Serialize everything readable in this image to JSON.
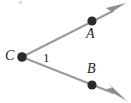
{
  "figure": {
    "kind": "geometry-angle-diagram",
    "width": 131,
    "height": 103,
    "background_color": "#ffffff",
    "vertex": {
      "name": "vertex-c",
      "label": "C",
      "x": 22,
      "y": 57
    },
    "points": [
      {
        "name": "point-a",
        "label": "A",
        "x": 92,
        "y": 21,
        "label_position": "below-right"
      },
      {
        "name": "point-b",
        "label": "B",
        "x": 92,
        "y": 85,
        "label_position": "above-right"
      }
    ],
    "angle": {
      "name": "angle-1",
      "label": "1",
      "label_x": 46,
      "label_y": 57
    },
    "rays": [
      {
        "name": "ray-ca",
        "from": "C",
        "through": "A",
        "start": {
          "x": 22,
          "y": 57
        },
        "end": {
          "x": 122,
          "y": 6
        },
        "arrowhead": true
      },
      {
        "name": "ray-cb",
        "from": "C",
        "through": "B",
        "start": {
          "x": 22,
          "y": 57
        },
        "end": {
          "x": 122,
          "y": 97
        },
        "arrowhead": true
      }
    ],
    "style": {
      "ray_color": "#9a9a9a",
      "ray_width": 2,
      "arrow_color": "#8d8d8d",
      "dot_color": "#2b2b2b",
      "dot_radius": 4.6,
      "label_color": "#1c1c1c"
    }
  }
}
